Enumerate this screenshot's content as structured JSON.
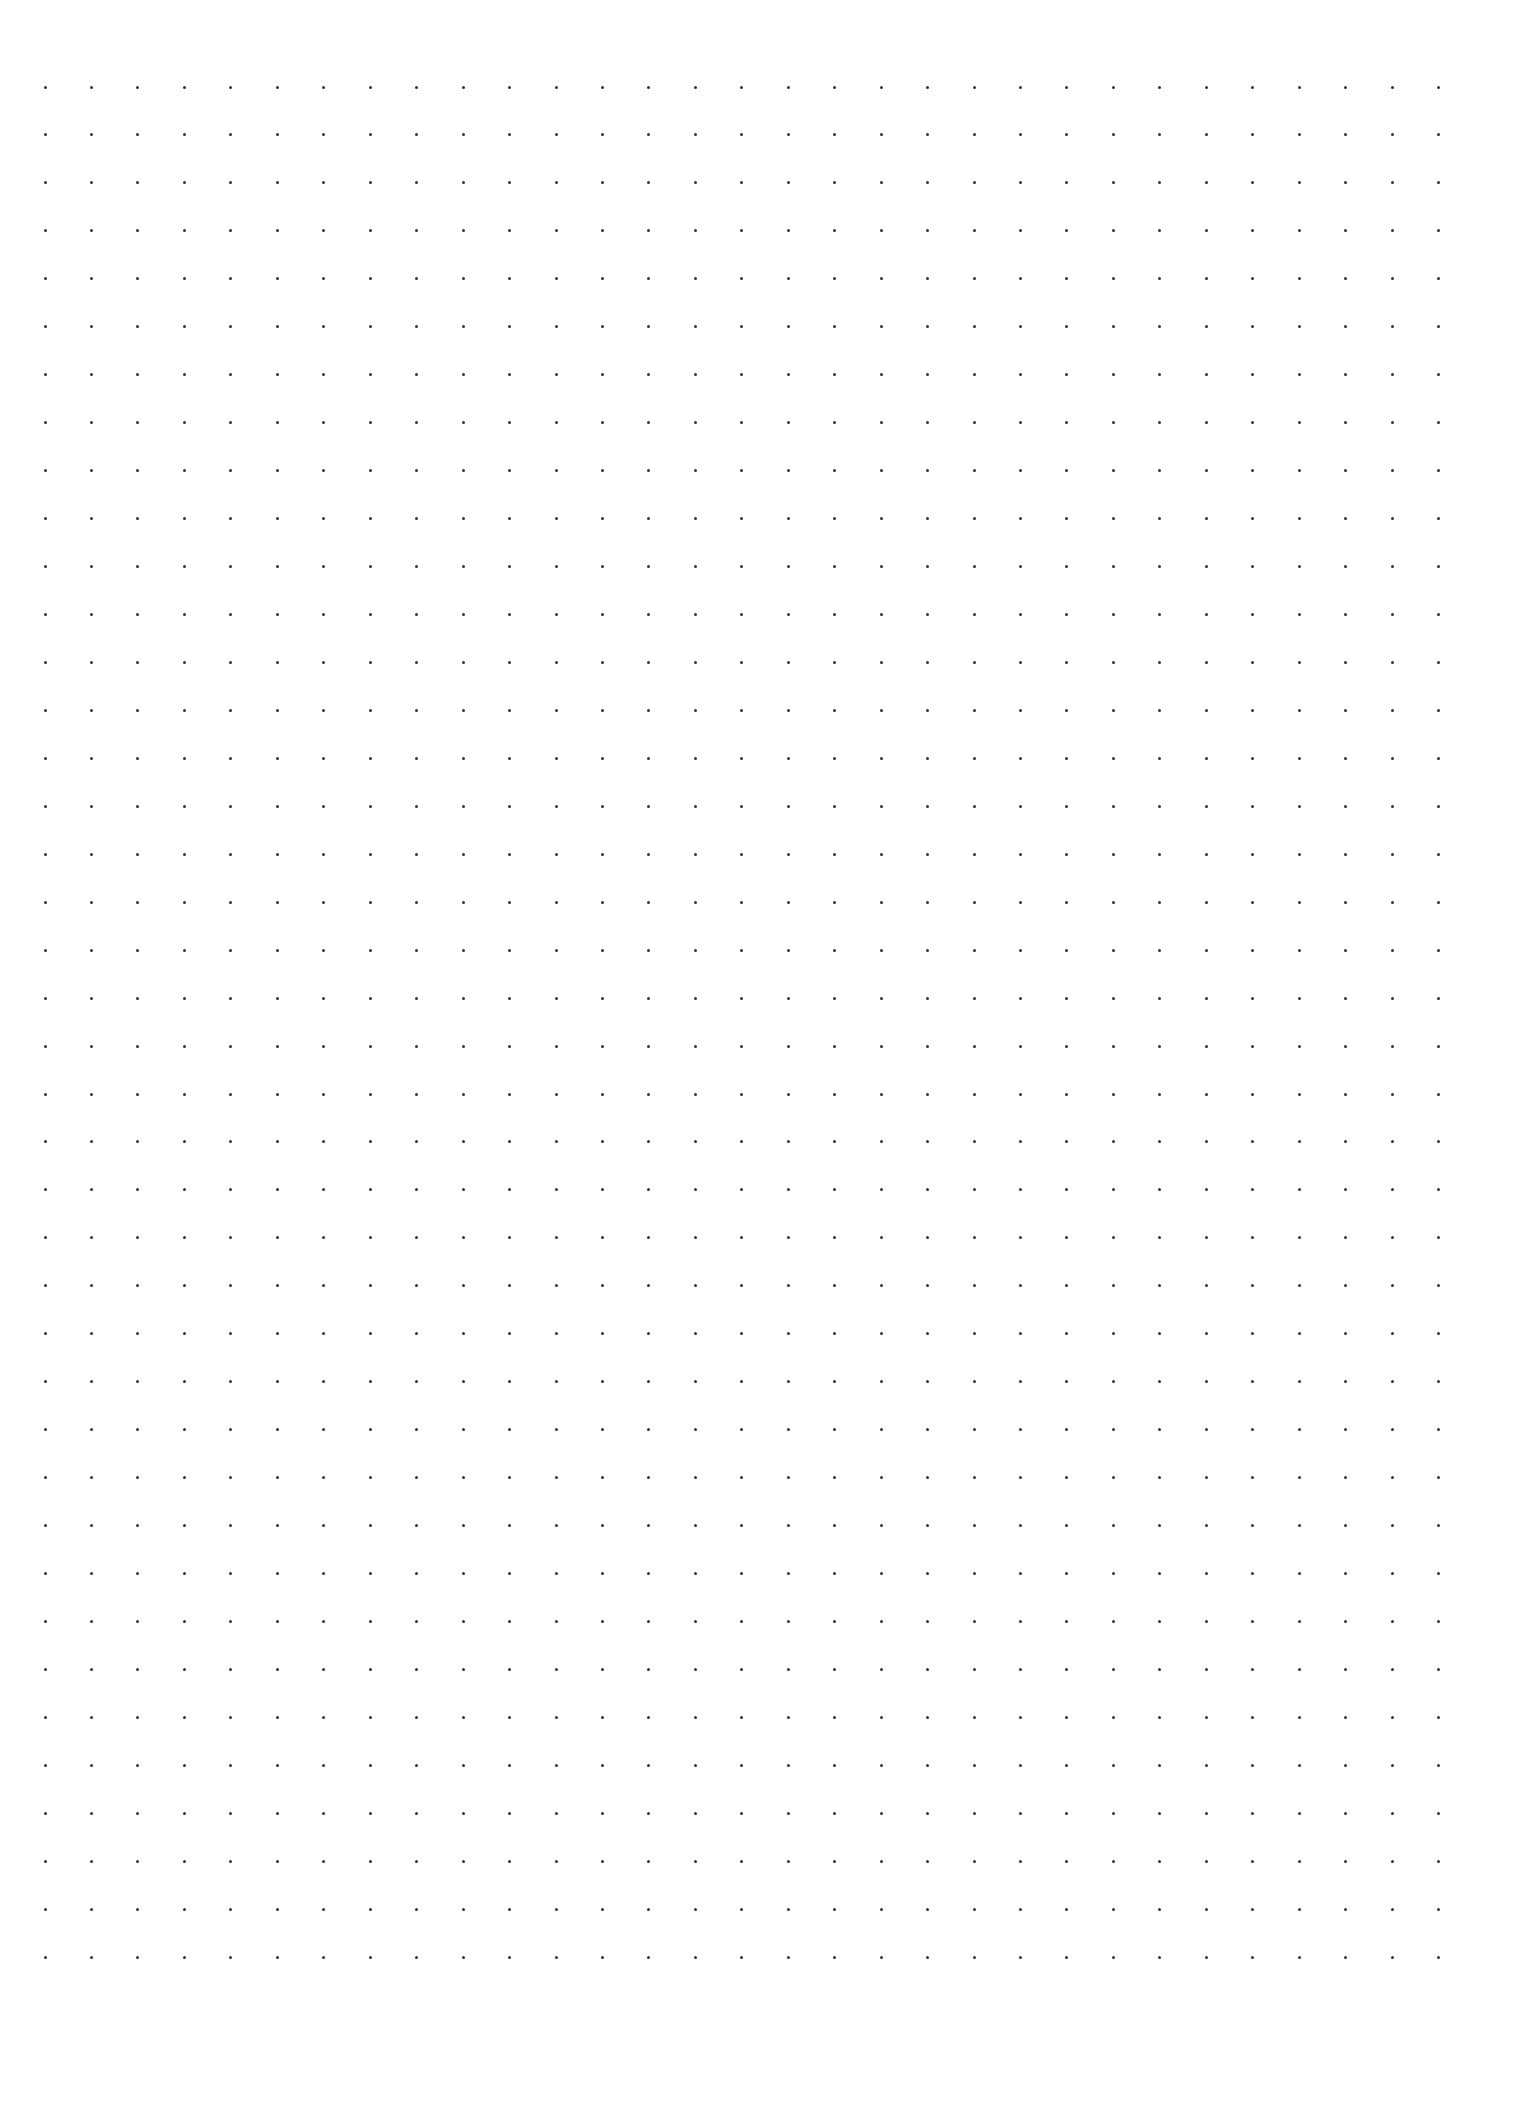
{
  "page": {
    "type": "dot-grid-paper",
    "background_color": "#ffffff",
    "width": 1520,
    "height": 2113
  },
  "grid": {
    "columns": 31,
    "rows": 40,
    "origin_x": 45,
    "origin_y": 87,
    "pitch_x": 46.45,
    "pitch_y": 47.95,
    "dot_size": 3,
    "dot_color": "#333333"
  }
}
